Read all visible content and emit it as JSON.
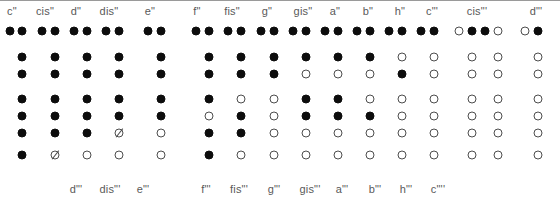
{
  "chart_data": {
    "type": "table",
    "row_count": 7,
    "row_y": [
      31,
      57,
      74,
      99,
      116,
      133,
      155
    ],
    "top_labels": [
      {
        "text": "c\"",
        "x": 12
      },
      {
        "text": "cis\"",
        "x": 45
      },
      {
        "text": "d\"",
        "x": 76
      },
      {
        "text": "dis\"",
        "x": 109
      },
      {
        "text": "e\"",
        "x": 150
      },
      {
        "text": "f\"",
        "x": 197
      },
      {
        "text": "fis\"",
        "x": 232
      },
      {
        "text": "g\"",
        "x": 267
      },
      {
        "text": "gis\"",
        "x": 303
      },
      {
        "text": "a\"",
        "x": 335
      },
      {
        "text": "b\"",
        "x": 368
      },
      {
        "text": "h\"",
        "x": 400
      },
      {
        "text": "c\"'",
        "x": 432
      },
      {
        "text": "cis\"'",
        "x": 477
      },
      {
        "text": "d\"'",
        "x": 536
      }
    ],
    "bottom_labels": [
      {
        "text": "d\"'",
        "x": 76
      },
      {
        "text": "dis\"'",
        "x": 110
      },
      {
        "text": "e\"'",
        "x": 143
      },
      {
        "text": "f\"'",
        "x": 206
      },
      {
        "text": "fis\"'",
        "x": 239
      },
      {
        "text": "g\"'",
        "x": 274
      },
      {
        "text": "gis\"'",
        "x": 310
      },
      {
        "text": "a\"'",
        "x": 342
      },
      {
        "text": "b\"'",
        "x": 375
      },
      {
        "text": "h\"'",
        "x": 406
      },
      {
        "text": "c\"''",
        "x": 438
      }
    ],
    "columns": [
      {
        "name": "c\"",
        "thumb_x": 10,
        "x": 22,
        "holes": [
          "closed",
          "closed",
          "closed",
          "closed",
          "closed",
          "closed"
        ],
        "thumb": "closed",
        "foot": {
          "x": 22,
          "state": "closed"
        }
      },
      {
        "name": "cis\"",
        "thumb_x": 42,
        "x": 55,
        "holes": [
          "closed",
          "closed",
          "closed",
          "closed",
          "closed",
          "closed"
        ],
        "thumb": "closed",
        "foot": {
          "x": 55,
          "state": "half"
        }
      },
      {
        "name": "d\"",
        "thumb_x": 74,
        "x": 87,
        "holes": [
          "closed",
          "closed",
          "closed",
          "closed",
          "closed",
          "closed"
        ],
        "thumb": "closed",
        "foot": {
          "x": 87,
          "state": "open"
        }
      },
      {
        "name": "dis\"",
        "thumb_x": 106,
        "x": 119,
        "holes": [
          "closed",
          "closed",
          "closed",
          "closed",
          "closed",
          "half"
        ],
        "thumb": "closed",
        "foot": {
          "x": 119,
          "state": "open"
        }
      },
      {
        "name": "e\"",
        "thumb_x": 148,
        "x": 161,
        "holes": [
          "closed",
          "closed",
          "closed",
          "closed",
          "closed",
          "open"
        ],
        "thumb": "closed",
        "foot": {
          "x": 161,
          "state": "open"
        }
      },
      {
        "name": "f\"",
        "thumb_x": 196,
        "x": 209,
        "holes": [
          "closed",
          "closed",
          "closed",
          "closed",
          "open",
          "closed"
        ],
        "thumb": "closed",
        "foot": {
          "x": 209,
          "state": "closed"
        }
      },
      {
        "name": "fis\"",
        "thumb_x": 228,
        "x": 241,
        "holes": [
          "closed",
          "closed",
          "closed",
          "open",
          "closed",
          "closed"
        ],
        "thumb": "closed",
        "foot": {
          "x": 241,
          "state": "open"
        }
      },
      {
        "name": "g\"",
        "thumb_x": 261,
        "x": 274,
        "holes": [
          "closed",
          "closed",
          "closed",
          "open",
          "open",
          "open"
        ],
        "thumb": "closed",
        "foot": {
          "x": 274,
          "state": "open"
        }
      },
      {
        "name": "gis\"",
        "thumb_x": 293,
        "x": 306,
        "holes": [
          "closed",
          "closed",
          "open",
          "closed",
          "closed",
          "open"
        ],
        "thumb": "closed",
        "foot": {
          "x": 306,
          "state": "open"
        }
      },
      {
        "name": "a\"",
        "thumb_x": 325,
        "x": 338,
        "holes": [
          "closed",
          "closed",
          "open",
          "closed",
          "closed",
          "open"
        ],
        "thumb": "closed",
        "foot": {
          "x": 338,
          "state": "open"
        }
      },
      {
        "name": "b\"",
        "thumb_x": 357,
        "x": 370,
        "holes": [
          "closed",
          "closed",
          "open",
          "open",
          "closed",
          "open"
        ],
        "thumb": "closed",
        "foot": {
          "x": 370,
          "state": "open"
        }
      },
      {
        "name": "h\"",
        "thumb_x": 389,
        "x": 402,
        "holes": [
          "closed",
          "open",
          "closed",
          "open",
          "open",
          "open"
        ],
        "thumb": "closed",
        "foot": {
          "x": 402,
          "state": "open"
        }
      },
      {
        "name": "c\"'",
        "thumb_x": 421,
        "x": 434,
        "holes": [
          "closed",
          "open",
          "open",
          "open",
          "open",
          "open"
        ],
        "thumb": "closed",
        "foot": {
          "x": 434,
          "state": "open"
        }
      },
      {
        "name": "cis\"'",
        "thumb_x": 459,
        "x": 472,
        "holes": [
          "closed",
          "open",
          "open",
          "open",
          "open",
          "open"
        ],
        "thumb": "open",
        "foot": {
          "x": 472,
          "state": "open"
        }
      },
      {
        "name": "cis\"'b",
        "thumb_x": 485,
        "x": 498,
        "holes": [
          "open",
          "open",
          "open",
          "open",
          "open",
          "open"
        ],
        "thumb": "closed",
        "foot": {
          "x": 498,
          "state": "open"
        }
      },
      {
        "name": "d\"'",
        "thumb_x": 525,
        "x": 538,
        "holes": [
          "closed",
          "open",
          "open",
          "open",
          "open",
          "open"
        ],
        "thumb": "open",
        "foot": {
          "x": 538,
          "state": "open"
        }
      }
    ]
  }
}
